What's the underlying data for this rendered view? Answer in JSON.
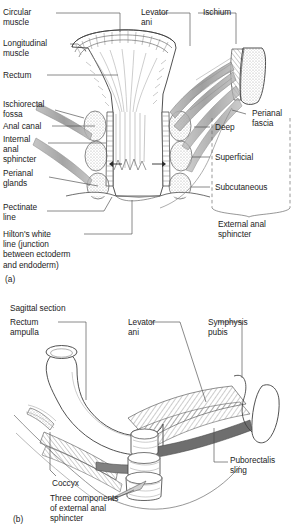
{
  "figure": {
    "panels": [
      {
        "id": "(a)",
        "caption": "",
        "labels": {
          "circular_muscle": "Circular\nmuscle",
          "longitudinal_muscle": "Longitudinal\nmuscle",
          "rectum": "Rectum",
          "ischiorectal_fossa": "Ischiorectal\nfossa",
          "anal_canal": "Anal canal",
          "internal_anal_sphincter": "Internal\nanal\nsphincter",
          "perianal_glands": "Perianal\nglands",
          "pectinate_line": "Pectinate\nline",
          "hiltons_white_line": "Hilton's white\nline (junction\nbetween ectoderm\nand endoderm)",
          "levator_ani": "Levator\nani",
          "ischium": "Ischium",
          "perianal_fascia": "Perianal\nfascia",
          "deep": "Deep",
          "superficial": "Superficial",
          "subcutaneous": "Subcutaneous",
          "external_anal_sphincter": "External anal\nsphincter"
        }
      },
      {
        "id": "(b)",
        "title": "Sagittal section",
        "labels": {
          "rectum_ampulla": "Rectum\nampulla",
          "levator_ani": "Levator\nani",
          "symphysis_pubis": "Symphysis\npubis",
          "puborectalis_sling": "Puborectalis\nsling",
          "coccyx": "Coccyx",
          "three_components": "Three components\nof external anal\nsphincter"
        }
      }
    ]
  },
  "colors": {
    "ink": "#1d1d1d",
    "line": "#4a4a4a",
    "muscle_gray": "#9a9a9a",
    "stipple": "#bdbdbd",
    "background": "#ffffff"
  }
}
